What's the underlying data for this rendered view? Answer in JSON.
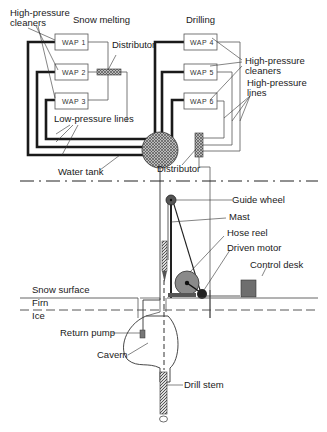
{
  "diagram": {
    "sections": {
      "snow_melting": "Snow melting",
      "drilling": "Drilling"
    },
    "units": {
      "wap1": "WAP 1",
      "wap2": "WAP 2",
      "wap3": "WAP 3",
      "wap4": "WAP 4",
      "wap5": "WAP 5",
      "wap6": "WAP 6"
    },
    "labels": {
      "hp_cleaners_left_1": "High-pressure",
      "hp_cleaners_left_2": "cleaners",
      "distributor_top": "Distributor",
      "hp_cleaners_right_1": "High-pressure",
      "hp_cleaners_right_2": "cleaners",
      "hp_lines_1": "High-pressure",
      "hp_lines_2": "lines",
      "low_pressure_lines": "Low-pressure lines",
      "water_tank": "Water tank",
      "distributor_bottom": "Distributor",
      "guide_wheel": "Guide wheel",
      "mast": "Mast",
      "hose_reel": "Hose reel",
      "driven_motor": "Driven motor",
      "control_desk": "Control desk",
      "snow_surface": "Snow surface",
      "firn": "Firn",
      "ice": "Ice",
      "return_pump": "Return pump",
      "cavern": "Cavern",
      "drill_stem": "Drill stem"
    },
    "colors": {
      "line": "#1a1a1a",
      "thin_line": "#555555",
      "hatch_fill": "#888888",
      "reel_fill": "#8a8a8a",
      "motor_fill": "#222222",
      "desk_fill": "#6e6e6e"
    }
  }
}
